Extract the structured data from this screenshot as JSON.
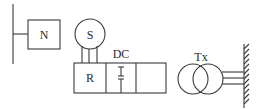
{
  "diagram": {
    "type": "electrical-schematic",
    "components": {
      "busbar": {
        "label": ""
      },
      "node_box": {
        "label": "N"
      },
      "source_circle": {
        "label": "S"
      },
      "rectifier_box": {
        "label": "R"
      },
      "dc_link": {
        "label": "DC"
      },
      "output_box": {
        "label": ""
      },
      "transformer": {
        "label": "Tx"
      },
      "ground_wall": {
        "label": ""
      }
    },
    "colors": {
      "stroke": "#3a3a3a",
      "text": "#2a2a2a",
      "background": "#ffffff"
    }
  }
}
